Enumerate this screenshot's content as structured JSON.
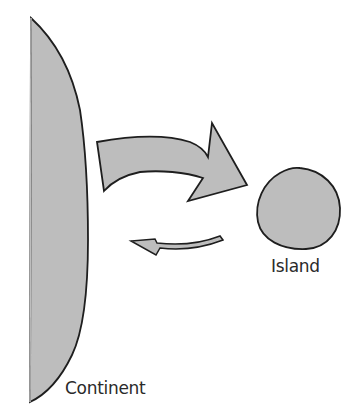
{
  "diagram": {
    "type": "island-biogeography",
    "colors": {
      "fill": "#bdbdbd",
      "stroke": "#1e1e1e",
      "background": "#ffffff",
      "text": "#2a2a2a"
    },
    "nodes": {
      "continent": {
        "label": "Continent"
      },
      "island": {
        "label": "Island"
      }
    },
    "edges": [
      {
        "from": "continent",
        "to": "island",
        "style": "large-curved-arrow"
      },
      {
        "from": "island",
        "to": "continent",
        "style": "small-curved-arrow"
      }
    ]
  }
}
